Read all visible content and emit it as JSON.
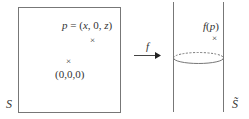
{
  "left_panel": {
    "space_label": "S",
    "point_p_label": "p = (x, 0, z)",
    "point_p_marker": "×",
    "origin_marker": "×",
    "origin_label": "(0,0,0)"
  },
  "map": {
    "label": "f",
    "arrow": "arrow-right"
  },
  "right_panel": {
    "space_label": "S̃",
    "image_point_label": "f(p)",
    "image_point_marker": "×"
  },
  "colors": {
    "stroke": "#555555",
    "text": "#333333"
  }
}
